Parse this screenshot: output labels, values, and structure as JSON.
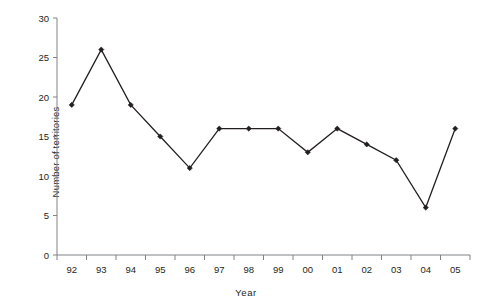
{
  "chart_data": {
    "type": "line",
    "title": "",
    "xlabel": "Year",
    "ylabel": "Number of territories",
    "categories": [
      "92",
      "93",
      "94",
      "95",
      "96",
      "97",
      "98",
      "99",
      "00",
      "01",
      "02",
      "03",
      "04",
      "05"
    ],
    "values": [
      19,
      26,
      19,
      15,
      11,
      16,
      16,
      16,
      13,
      16,
      14,
      12,
      6,
      16
    ],
    "series": [
      {
        "name": "Number of territories",
        "values": [
          19,
          26,
          19,
          15,
          11,
          16,
          16,
          16,
          13,
          16,
          14,
          12,
          6,
          16
        ]
      }
    ],
    "ylim": [
      0,
      30
    ],
    "y_ticks": [
      0,
      5,
      10,
      15,
      20,
      25,
      30
    ],
    "y_tick_labels": [
      "0",
      "5",
      "10",
      "15",
      "20",
      "25",
      "30"
    ],
    "x_tick_labels": [
      "92",
      "93",
      "94",
      "95",
      "96",
      "97",
      "98",
      "99",
      "00",
      "01",
      "02",
      "03",
      "04",
      "05"
    ],
    "grid": false,
    "legend": null,
    "legend_position": "none",
    "marker": "diamond",
    "line_color": "#231f20",
    "marker_color": "#231f20",
    "background_color": "#ffffff",
    "axis_color": "#808285"
  },
  "axes": {
    "y_title": "Number of territories",
    "x_title": "Year"
  }
}
